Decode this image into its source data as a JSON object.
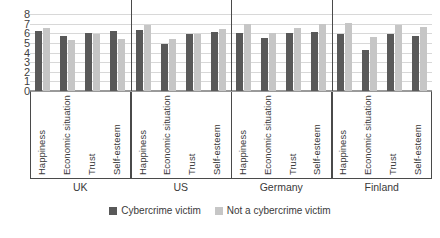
{
  "chart_data": {
    "type": "bar",
    "title": "",
    "subtitle": "",
    "xlabel": "",
    "ylabel": "",
    "ylim": [
      0,
      8
    ],
    "y_ticks": [
      8,
      7,
      6,
      5,
      4,
      3,
      2,
      1,
      0
    ],
    "grid": true,
    "legend_position": "bottom",
    "group_labels": [
      "UK",
      "US",
      "Germany",
      "Finland"
    ],
    "categories": [
      "Happiness",
      "Economic situation",
      "Trust",
      "Self-esteem"
    ],
    "series": [
      {
        "name": "Cybercrime victim",
        "color": "#595959",
        "values": [
          [
            6.2,
            5.7,
            6.0,
            6.2
          ],
          [
            6.3,
            4.9,
            5.9,
            6.1
          ],
          [
            6.0,
            5.5,
            6.0,
            6.1
          ],
          [
            5.9,
            4.3,
            5.9,
            5.7
          ]
        ]
      },
      {
        "name": "Not a cybercrime victim",
        "color": "#C6C6C6",
        "values": [
          [
            6.5,
            5.3,
            5.9,
            5.4
          ],
          [
            6.9,
            5.4,
            5.9,
            6.4
          ],
          [
            7.0,
            6.0,
            6.5,
            7.0
          ],
          [
            7.1,
            5.6,
            6.9,
            6.7
          ]
        ]
      }
    ]
  },
  "legend": {
    "items": [
      {
        "label": "Cybercrime victim",
        "color": "#595959"
      },
      {
        "label": "Not a cybercrime victim",
        "color": "#C6C6C6"
      }
    ]
  }
}
